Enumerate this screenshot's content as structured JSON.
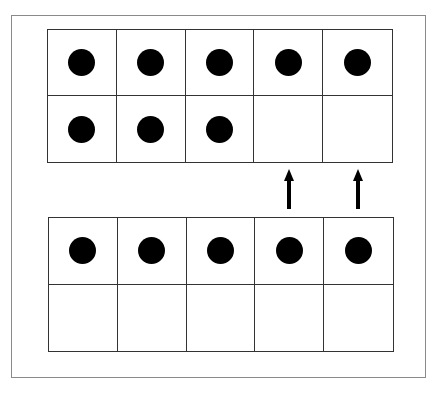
{
  "diagram": {
    "type": "ten-frames",
    "colors": {
      "counter": "#000000",
      "grid_line": "#333333",
      "frame_border": "#8a8a8a"
    },
    "top_frame": {
      "rows": [
        [
          true,
          true,
          true,
          true,
          true
        ],
        [
          true,
          true,
          true,
          false,
          false
        ]
      ],
      "counter_count": 8
    },
    "bottom_frame": {
      "rows": [
        [
          true,
          true,
          true,
          true,
          true
        ],
        [
          false,
          false,
          false,
          false,
          false
        ]
      ],
      "counter_count": 5
    },
    "arrows": [
      {
        "direction": "up",
        "from_column": 4,
        "to_column": 4
      },
      {
        "direction": "up",
        "from_column": 5,
        "to_column": 5
      }
    ]
  }
}
